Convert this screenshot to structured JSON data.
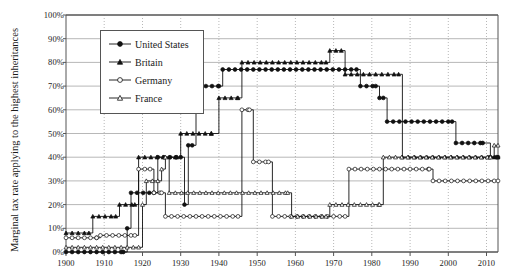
{
  "chart_data": {
    "type": "line",
    "title": "",
    "xlabel": "",
    "ylabel": "Marginal tax rate applying to the highest inheritances",
    "xlim": [
      1900,
      2013
    ],
    "ylim": [
      0,
      100
    ],
    "grid": true,
    "legend_position": "top-left inside",
    "xticks": [
      "1900",
      "1910",
      "1920",
      "1930",
      "1940",
      "1950",
      "1960",
      "1970",
      "1980",
      "1990",
      "2000",
      "2010"
    ],
    "xtick_values": [
      1900,
      1910,
      1920,
      1930,
      1940,
      1950,
      1960,
      1970,
      1980,
      1990,
      2000,
      2010
    ],
    "yticks": [
      "0%",
      "10%",
      "20%",
      "30%",
      "40%",
      "50%",
      "60%",
      "70%",
      "80%",
      "90%",
      "100%"
    ],
    "ytick_values": [
      0,
      10,
      20,
      30,
      40,
      50,
      60,
      70,
      80,
      90,
      100
    ],
    "series": [
      {
        "name": "United States",
        "marker": "filled-circle",
        "color": "#111111",
        "points": [
          [
            1900,
            0
          ],
          [
            1915,
            0
          ],
          [
            1916,
            10
          ],
          [
            1917,
            25
          ],
          [
            1918,
            25
          ],
          [
            1923,
            25
          ],
          [
            1924,
            40
          ],
          [
            1925,
            40
          ],
          [
            1931,
            20
          ],
          [
            1932,
            45
          ],
          [
            1934,
            60
          ],
          [
            1935,
            70
          ],
          [
            1940,
            70
          ],
          [
            1941,
            77
          ],
          [
            1942,
            77
          ],
          [
            1976,
            77
          ],
          [
            1977,
            70
          ],
          [
            1981,
            70
          ],
          [
            1982,
            65
          ],
          [
            1983,
            60
          ],
          [
            1984,
            55
          ],
          [
            2001,
            55
          ],
          [
            2002,
            50
          ],
          [
            2003,
            49
          ],
          [
            2004,
            48
          ],
          [
            2005,
            47
          ],
          [
            2006,
            46
          ],
          [
            2007,
            45
          ],
          [
            2009,
            45
          ],
          [
            2010,
            0
          ],
          [
            2011,
            35
          ],
          [
            2013,
            40
          ]
        ],
        "steps": [
          {
            "from": 1900,
            "to": 1915,
            "value": 0
          },
          {
            "from": 1916,
            "to": 1916,
            "value": 10
          },
          {
            "from": 1917,
            "to": 1923,
            "value": 25
          },
          {
            "from": 1924,
            "to": 1930,
            "value": 40
          },
          {
            "from": 1931,
            "to": 1931,
            "value": 20
          },
          {
            "from": 1932,
            "to": 1933,
            "value": 45
          },
          {
            "from": 1934,
            "to": 1934,
            "value": 60
          },
          {
            "from": 1935,
            "to": 1940,
            "value": 70
          },
          {
            "from": 1941,
            "to": 1976,
            "value": 77
          },
          {
            "from": 1977,
            "to": 1981,
            "value": 70
          },
          {
            "from": 1982,
            "to": 1983,
            "value": 65
          },
          {
            "from": 1984,
            "to": 2001,
            "value": 55
          },
          {
            "from": 2002,
            "to": 2009,
            "value": 46
          },
          {
            "from": 2011,
            "to": 2013,
            "value": 40
          }
        ]
      },
      {
        "name": "Britain",
        "marker": "filled-triangle",
        "color": "#111111",
        "points": [
          [
            1900,
            8
          ],
          [
            1906,
            8
          ],
          [
            1907,
            15
          ],
          [
            1913,
            15
          ],
          [
            1914,
            20
          ],
          [
            1918,
            20
          ],
          [
            1919,
            40
          ],
          [
            1929,
            40
          ],
          [
            1930,
            50
          ],
          [
            1938,
            50
          ],
          [
            1939,
            60
          ],
          [
            1940,
            65
          ],
          [
            1946,
            75
          ],
          [
            1949,
            80
          ],
          [
            1968,
            80
          ],
          [
            1969,
            85
          ],
          [
            1972,
            85
          ],
          [
            1973,
            75
          ],
          [
            1975,
            75
          ],
          [
            1976,
            75
          ],
          [
            1977,
            75
          ],
          [
            1979,
            75
          ],
          [
            1980,
            75
          ],
          [
            1983,
            60
          ],
          [
            1984,
            60
          ],
          [
            1987,
            60
          ],
          [
            1988,
            40
          ],
          [
            2013,
            40
          ]
        ],
        "steps": [
          {
            "from": 1900,
            "to": 1906,
            "value": 8
          },
          {
            "from": 1907,
            "to": 1913,
            "value": 15
          },
          {
            "from": 1914,
            "to": 1918,
            "value": 20
          },
          {
            "from": 1919,
            "to": 1929,
            "value": 40
          },
          {
            "from": 1930,
            "to": 1938,
            "value": 50
          },
          {
            "from": 1940,
            "to": 1945,
            "value": 65
          },
          {
            "from": 1946,
            "to": 1968,
            "value": 80
          },
          {
            "from": 1969,
            "to": 1972,
            "value": 85
          },
          {
            "from": 1973,
            "to": 1987,
            "value": 75
          },
          {
            "from": 1988,
            "to": 2013,
            "value": 40
          }
        ]
      },
      {
        "name": "Germany",
        "marker": "open-circle",
        "color": "#111111",
        "points": [
          [
            1900,
            6
          ],
          [
            1908,
            6
          ],
          [
            1909,
            7
          ],
          [
            1918,
            7
          ],
          [
            1919,
            35
          ],
          [
            1922,
            35
          ],
          [
            1923,
            25
          ],
          [
            1925,
            25
          ],
          [
            1926,
            15
          ],
          [
            1945,
            15
          ],
          [
            1946,
            60
          ],
          [
            1948,
            60
          ],
          [
            1949,
            38
          ],
          [
            1953,
            38
          ],
          [
            1954,
            15
          ],
          [
            1973,
            15
          ],
          [
            1974,
            35
          ],
          [
            1995,
            35
          ],
          [
            1996,
            30
          ],
          [
            2008,
            30
          ],
          [
            2009,
            30
          ],
          [
            2013,
            30
          ]
        ],
        "steps": [
          {
            "from": 1900,
            "to": 1908,
            "value": 6
          },
          {
            "from": 1909,
            "to": 1918,
            "value": 7
          },
          {
            "from": 1919,
            "to": 1922,
            "value": 35
          },
          {
            "from": 1923,
            "to": 1925,
            "value": 25
          },
          {
            "from": 1926,
            "to": 1945,
            "value": 15
          },
          {
            "from": 1946,
            "to": 1948,
            "value": 60
          },
          {
            "from": 1949,
            "to": 1953,
            "value": 38
          },
          {
            "from": 1954,
            "to": 1973,
            "value": 15
          },
          {
            "from": 1974,
            "to": 1995,
            "value": 35
          },
          {
            "from": 1996,
            "to": 2013,
            "value": 30
          }
        ]
      },
      {
        "name": "France",
        "marker": "open-triangle",
        "color": "#111111",
        "points": [
          [
            1900,
            1
          ],
          [
            1901,
            2
          ],
          [
            1902,
            2
          ],
          [
            1919,
            2
          ],
          [
            1920,
            20
          ],
          [
            1921,
            30
          ],
          [
            1924,
            30
          ],
          [
            1925,
            35
          ],
          [
            1926,
            40
          ],
          [
            1927,
            25
          ],
          [
            1958,
            25
          ],
          [
            1959,
            15
          ],
          [
            1968,
            15
          ],
          [
            1969,
            20
          ],
          [
            1982,
            20
          ],
          [
            1983,
            40
          ],
          [
            2011,
            40
          ],
          [
            2012,
            45
          ],
          [
            2013,
            45
          ]
        ],
        "steps": [
          {
            "from": 1900,
            "to": 1919,
            "value": 2
          },
          {
            "from": 1920,
            "to": 1920,
            "value": 20
          },
          {
            "from": 1921,
            "to": 1924,
            "value": 30
          },
          {
            "from": 1925,
            "to": 1925,
            "value": 35
          },
          {
            "from": 1926,
            "to": 1926,
            "value": 40
          },
          {
            "from": 1927,
            "to": 1958,
            "value": 25
          },
          {
            "from": 1959,
            "to": 1968,
            "value": 15
          },
          {
            "from": 1969,
            "to": 1982,
            "value": 20
          },
          {
            "from": 1983,
            "to": 2011,
            "value": 40
          },
          {
            "from": 2012,
            "to": 2013,
            "value": 45
          }
        ]
      }
    ]
  },
  "legend": {
    "entries": [
      {
        "label": "United States",
        "marker": "filled-circle"
      },
      {
        "label": "Britain",
        "marker": "filled-triangle"
      },
      {
        "label": "Germany",
        "marker": "open-circle"
      },
      {
        "label": "France",
        "marker": "open-triangle"
      }
    ]
  }
}
